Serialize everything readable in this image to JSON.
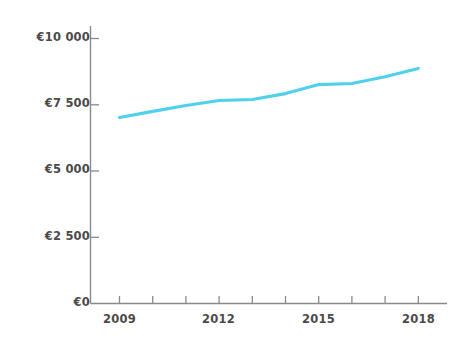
{
  "chart_data": {
    "type": "line",
    "title": "",
    "subtitle": "",
    "xlabel": "",
    "ylabel": "",
    "x": [
      2009,
      2010,
      2011,
      2012,
      2013,
      2014,
      2015,
      2016,
      2017,
      2018
    ],
    "categories": [
      "2009",
      "2010",
      "2011",
      "2012",
      "2013",
      "2014",
      "2015",
      "2016",
      "2017",
      "2018"
    ],
    "series": [
      {
        "name": "",
        "color": "#4fd0ed",
        "values": [
          7020,
          7250,
          7470,
          7660,
          7700,
          7920,
          8260,
          8300,
          8560,
          8870
        ]
      }
    ],
    "xlim": [
      2008.5,
      2018.5
    ],
    "ylim": [
      0,
      10000
    ],
    "y_ticks": [
      0,
      2500,
      5000,
      7500,
      10000
    ],
    "y_tick_labels": [
      "€0",
      "€2 500",
      "€5 000",
      "€7 500",
      "€10 000"
    ],
    "x_ticks": [
      2009,
      2010,
      2011,
      2012,
      2013,
      2014,
      2015,
      2016,
      2017,
      2018
    ],
    "x_tick_labels_visible": [
      "2009",
      "2012",
      "2015",
      "2018"
    ],
    "x_labeled_ticks": [
      2009,
      2012,
      2015,
      2018
    ],
    "grid": false,
    "legend": "none",
    "currency_symbol": "€",
    "axis_color": "#8a8a8a",
    "text_color": "#4a4a4a",
    "background_color": "#ffffff",
    "annotations": []
  },
  "axis": {
    "y_labels": [
      {
        "text": "€10 000",
        "value": 10000
      },
      {
        "text": "€7 500",
        "value": 7500
      },
      {
        "text": "€5 000",
        "value": 5000
      },
      {
        "text": "€2 500",
        "value": 2500
      },
      {
        "text": "€0",
        "value": 0
      }
    ],
    "x_labels": [
      {
        "text": "2009",
        "value": 2009
      },
      {
        "text": "2012",
        "value": 2012
      },
      {
        "text": "2015",
        "value": 2015
      },
      {
        "text": "2018",
        "value": 2018
      }
    ]
  }
}
